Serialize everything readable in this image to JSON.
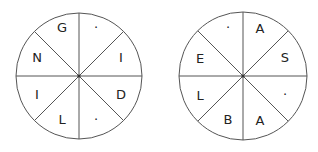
{
  "diagram": {
    "colors": {
      "line": "#555555",
      "text": "#222222",
      "background": "#ffffff"
    },
    "wheels": [
      {
        "name": "left-wheel",
        "sectors": [
          {
            "position": "top-left",
            "label": "G"
          },
          {
            "position": "top-right",
            "label": "·"
          },
          {
            "position": "right-upper",
            "label": "I"
          },
          {
            "position": "right-lower",
            "label": "D"
          },
          {
            "position": "bottom-right",
            "label": "·"
          },
          {
            "position": "bottom-left",
            "label": "L"
          },
          {
            "position": "left-lower",
            "label": "I"
          },
          {
            "position": "left-upper",
            "label": "N"
          }
        ]
      },
      {
        "name": "right-wheel",
        "sectors": [
          {
            "position": "top-left",
            "label": "·"
          },
          {
            "position": "top-right",
            "label": "A"
          },
          {
            "position": "right-upper",
            "label": "S"
          },
          {
            "position": "right-lower",
            "label": "·"
          },
          {
            "position": "bottom-right",
            "label": "A"
          },
          {
            "position": "bottom-left",
            "label": "B"
          },
          {
            "position": "left-lower",
            "label": "L"
          },
          {
            "position": "left-upper",
            "label": "E"
          }
        ]
      }
    ]
  }
}
